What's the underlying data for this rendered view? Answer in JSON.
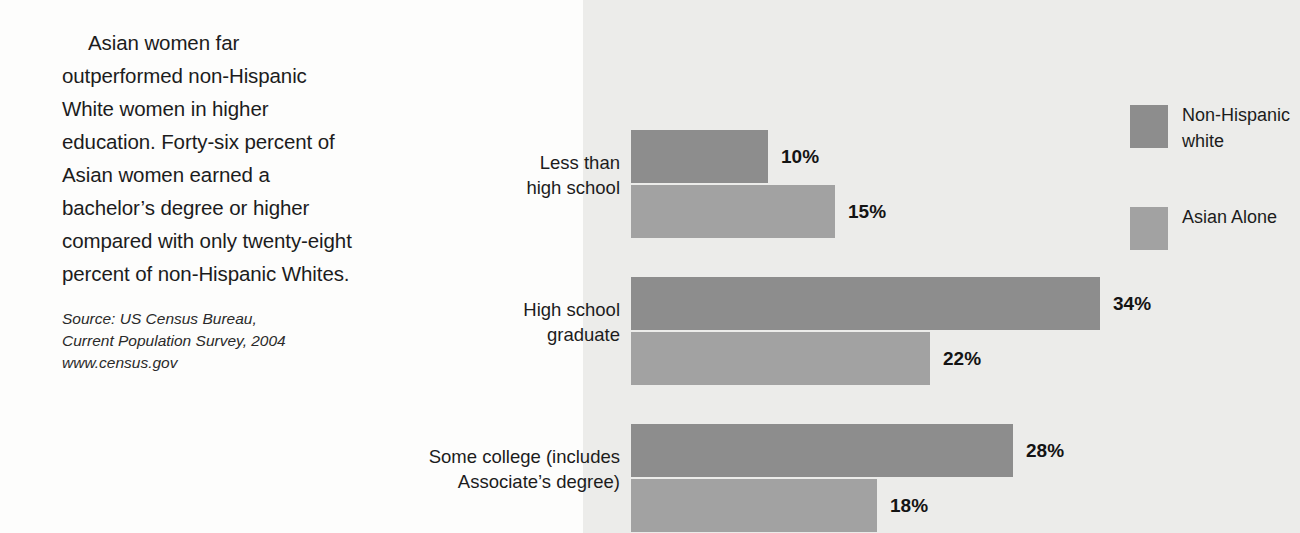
{
  "narrative": {
    "paragraph": "Asian women far outperformed non-Hispanic White women in higher education. Forty-six percent of Asian women earned a bachelor’s degree or higher compared with only twenty-eight percent of non-Hispanic Whites."
  },
  "source": {
    "line1": "Source: US Census Bureau,",
    "line2": "Current Population Survey, 2004",
    "line3": "www.census.gov"
  },
  "legend": {
    "items": [
      {
        "label": "Non-Hispanic white",
        "color": "#8d8d8d",
        "swatch_name": "legend-swatch-non-hispanic-white"
      },
      {
        "label": "Asian Alone",
        "color": "#a2a2a2",
        "swatch_name": "legend-swatch-asian-alone"
      }
    ]
  },
  "chart_data": {
    "type": "bar",
    "orientation": "horizontal",
    "title": "",
    "xlabel": "",
    "ylabel": "",
    "grid": false,
    "legend_position": "right",
    "categories": [
      "Less than high school",
      "High school graduate",
      "Some college (includes Associate's degree)"
    ],
    "category_label_lines": [
      [
        "Less than",
        "high school"
      ],
      [
        "High school",
        "graduate"
      ],
      [
        "Some college (includes",
        "Associate’s degree)"
      ]
    ],
    "series": [
      {
        "name": "Non-Hispanic white",
        "color": "#8d8d8d",
        "values": [
          10,
          15,
          28
        ],
        "value_labels": [
          "10%",
          "28%",
          "28%"
        ]
      },
      {
        "name": "Asian Alone",
        "color": "#a2a2a2",
        "values": [
          15,
          22,
          18
        ],
        "value_labels": [
          "15%",
          "22%",
          "18%"
        ]
      }
    ],
    "groups": [
      {
        "category": "Less than high school",
        "bars": [
          {
            "series": "Non-Hispanic white",
            "value": 10,
            "label": "10%",
            "pixel_width": 137,
            "color": "#8d8d8d"
          },
          {
            "series": "Asian Alone",
            "value": 15,
            "label": "15%",
            "pixel_width": 204,
            "color": "#a2a2a2"
          }
        ]
      },
      {
        "category": "High school graduate",
        "bars": [
          {
            "series": "Non-Hispanic white",
            "value": 34,
            "label": "34%",
            "pixel_width": 469,
            "color": "#8d8d8d"
          },
          {
            "series": "Asian Alone",
            "value": 22,
            "label": "22%",
            "pixel_width": 299,
            "color": "#a2a2a2"
          }
        ]
      },
      {
        "category": "Some college (includes Associate's degree)",
        "bars": [
          {
            "series": "Non-Hispanic white",
            "value": 28,
            "label": "28%",
            "pixel_width": 382,
            "color": "#8d8d8d"
          },
          {
            "series": "Asian Alone",
            "value": 18,
            "label": "18%",
            "pixel_width": 246,
            "color": "#a2a2a2"
          }
        ]
      }
    ],
    "ylim": [
      0,
      40
    ],
    "panel_background": "#ececea"
  }
}
